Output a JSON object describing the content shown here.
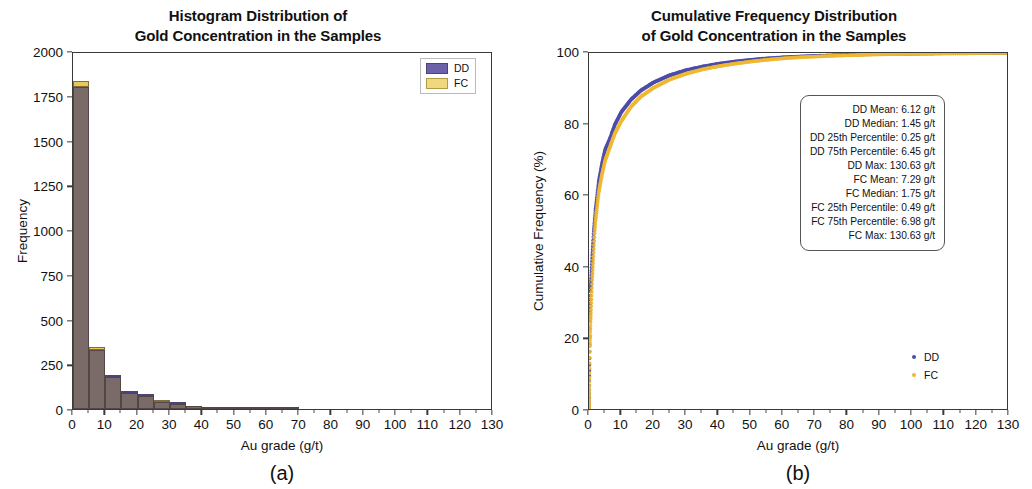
{
  "figure": {
    "caption_a": "(a)",
    "caption_b": "(b)"
  },
  "chart_data": [
    {
      "type": "bar",
      "panel": "a",
      "title": "Histogram Distribution of\nGold Concentration in the Samples",
      "title_line1": "Histogram Distribution of",
      "title_line2": "Gold Concentration in the Samples",
      "xlabel": "Au grade (g/t)",
      "ylabel": "Frequency",
      "xlim": [
        0,
        130
      ],
      "ylim": [
        0,
        2000
      ],
      "xticks": [
        0,
        10,
        20,
        30,
        40,
        50,
        60,
        70,
        80,
        90,
        100,
        110,
        120,
        130
      ],
      "yticks": [
        0,
        250,
        500,
        750,
        1000,
        1250,
        1500,
        1750,
        2000
      ],
      "grid": false,
      "bin_width": 5,
      "bin_starts": [
        0,
        5,
        10,
        15,
        20,
        25,
        30,
        35,
        40,
        45,
        50,
        55,
        60,
        65,
        70,
        75,
        80,
        85,
        90,
        95,
        100,
        105,
        110,
        115,
        120,
        125
      ],
      "legend_position": "upper right",
      "series": [
        {
          "name": "DD",
          "color": "#6b62a8",
          "values": [
            1800,
            330,
            185,
            92,
            78,
            40,
            30,
            18,
            14,
            10,
            7,
            5,
            4,
            3,
            2,
            2,
            1,
            1,
            1,
            1,
            1,
            0,
            0,
            0,
            0,
            1
          ]
        },
        {
          "name": "FC",
          "color": "#f0d87e",
          "values": [
            1832,
            348,
            180,
            88,
            74,
            48,
            26,
            20,
            12,
            9,
            6,
            5,
            3,
            3,
            2,
            1,
            1,
            1,
            1,
            0,
            1,
            0,
            0,
            0,
            0,
            1
          ]
        }
      ]
    },
    {
      "type": "line",
      "panel": "b",
      "title": "Cumulative Frequency Distribution\nof Gold Concentration in the Samples",
      "title_line1": "Cumulative Frequency Distribution",
      "title_line2": "of Gold Concentration in the Samples",
      "xlabel": "Au grade (g/t)",
      "ylabel": "Cumulative Frequency (%)",
      "xlim": [
        0,
        130
      ],
      "ylim": [
        0,
        100
      ],
      "xticks": [
        0,
        10,
        20,
        30,
        40,
        50,
        60,
        70,
        80,
        90,
        100,
        110,
        120,
        130
      ],
      "yticks": [
        0,
        20,
        40,
        60,
        80,
        100
      ],
      "grid": false,
      "legend_position": "lower right",
      "series": [
        {
          "name": "DD",
          "color": "#4d4da8",
          "x": [
            0,
            0.25,
            0.5,
            1,
            1.45,
            2,
            3,
            4,
            5,
            6.45,
            8,
            10,
            13,
            16,
            20,
            25,
            30,
            35,
            40,
            45,
            50,
            55,
            60,
            65,
            70,
            75,
            80,
            85,
            90,
            95,
            100,
            110,
            120,
            130.63
          ],
          "y": [
            0,
            25,
            34,
            43,
            50,
            56,
            64,
            69,
            73,
            76,
            80,
            83.5,
            87,
            89.5,
            91.8,
            93.8,
            95.2,
            96.2,
            97,
            97.6,
            98.1,
            98.5,
            98.8,
            99,
            99.2,
            99.35,
            99.5,
            99.6,
            99.7,
            99.75,
            99.8,
            99.9,
            99.95,
            100
          ]
        },
        {
          "name": "FC",
          "color": "#f0b830",
          "x": [
            0,
            0.25,
            0.49,
            1,
            1.75,
            2,
            3,
            4,
            5,
            6.98,
            8,
            10,
            13,
            16,
            20,
            25,
            30,
            35,
            40,
            45,
            50,
            55,
            60,
            65,
            70,
            75,
            80,
            85,
            90,
            95,
            100,
            110,
            120,
            130.63
          ],
          "y": [
            0,
            18,
            25,
            37,
            50,
            53,
            61,
            66,
            70,
            75,
            77.5,
            81,
            85,
            87.8,
            90.3,
            92.6,
            94.2,
            95.4,
            96.3,
            97,
            97.6,
            98.1,
            98.5,
            98.8,
            99,
            99.2,
            99.35,
            99.5,
            99.6,
            99.7,
            99.75,
            99.88,
            99.94,
            100
          ]
        }
      ],
      "annotation_box": {
        "lines": [
          "DD Mean: 6.12 g/t",
          "DD Median: 1.45 g/t",
          "DD 25th Percentile: 0.25 g/t",
          "DD 75th Percentile: 6.45 g/t",
          "DD Max: 130.63 g/t",
          "FC Mean: 7.29 g/t",
          "FC Median: 1.75 g/t",
          "FC 25th Percentile: 0.49 g/t",
          "FC 75th Percentile: 6.98 g/t",
          "FC Max: 130.63 g/t"
        ]
      }
    }
  ]
}
